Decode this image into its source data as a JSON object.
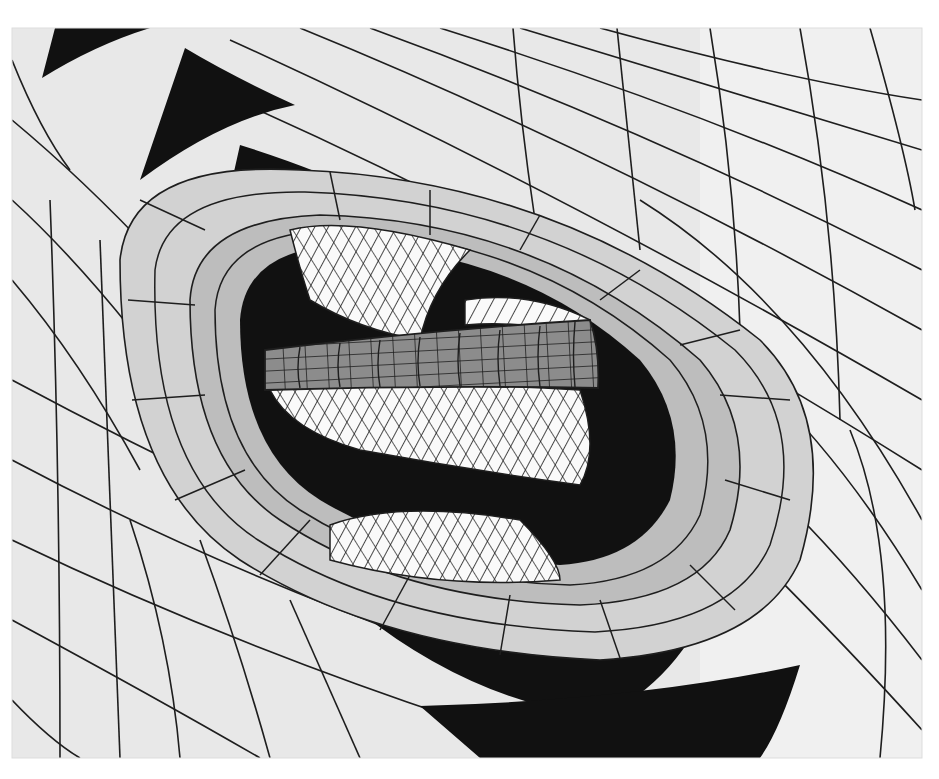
{
  "figure": {
    "frame": {
      "x": 12,
      "y": 28,
      "width": 910,
      "height": 730
    },
    "palette": {
      "background": "#ffffff",
      "outer_surface": "#e6e6e6",
      "ring_1": "#d4d4d4",
      "ring_2": "#c2c2c2",
      "ring_3": "#a9a9a9",
      "core_band": "#8c8c8c",
      "core_hyperboloid": "#fafafa",
      "shadow": "#111111",
      "mesh_line": "#1e1e1e"
    },
    "layers": [
      {
        "name": "outer-surface",
        "shade": "outer_surface"
      },
      {
        "name": "ring-1",
        "shade": "ring_1"
      },
      {
        "name": "ring-2",
        "shade": "ring_2"
      },
      {
        "name": "ring-3",
        "shade": "ring_3"
      },
      {
        "name": "hyperboloid-core",
        "shade": "core_hyperboloid"
      },
      {
        "name": "cylinder-band",
        "shade": "core_band"
      }
    ]
  }
}
